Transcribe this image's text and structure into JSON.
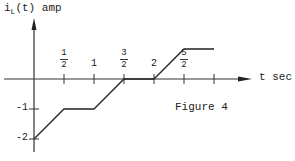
{
  "chart_data": {
    "type": "line",
    "title": "Figure 4",
    "ylabel": "i_L(t) amp",
    "ylabel_main": "i",
    "ylabel_sub": "L",
    "ylabel_rest": "(t) amp",
    "xlabel": "t sec",
    "x_ticks": [
      {
        "value": 0.5,
        "num": "1",
        "den": "2"
      },
      {
        "value": 1,
        "label": "1"
      },
      {
        "value": 1.5,
        "num": "3",
        "den": "2"
      },
      {
        "value": 2,
        "label": "2"
      },
      {
        "value": 2.5,
        "num": "5",
        "den": "2"
      },
      {
        "value": 3,
        "label": ""
      }
    ],
    "y_ticks": [
      {
        "value": -1,
        "label": "-1"
      },
      {
        "value": -2,
        "label": "-2"
      }
    ],
    "x": [
      0,
      0.5,
      1,
      1.5,
      2,
      2.5,
      3
    ],
    "values": [
      -2,
      -1,
      -1,
      0,
      0,
      1,
      1
    ],
    "xlim": [
      0,
      3.5
    ],
    "ylim": [
      -2.5,
      2
    ],
    "grid": false,
    "legend": null,
    "color": "#222222"
  },
  "figure_label": "Figure 4"
}
